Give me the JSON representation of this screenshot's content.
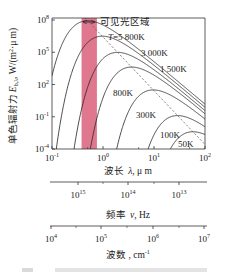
{
  "chart_data": {
    "type": "line",
    "title": "",
    "y_scale": "log",
    "x_scale": "log",
    "ylabel": "单色辐射力 E_b,λ, W/(m²·μm)",
    "xlabel": "波长 λ, μm",
    "xlim": [
      0.1,
      100
    ],
    "ylim": [
      0.0001,
      100000000
    ],
    "x_ticks": [
      {
        "value": 0.1,
        "base": "10",
        "exp": "-1"
      },
      {
        "value": 1,
        "base": "10",
        "exp": "0"
      },
      {
        "value": 10,
        "base": "10",
        "exp": "1"
      },
      {
        "value": 100,
        "base": "10",
        "exp": "2"
      }
    ],
    "y_ticks": [
      {
        "value": 100000000,
        "base": "10",
        "exp": "8"
      },
      {
        "value": 100000,
        "base": "10",
        "exp": "5"
      },
      {
        "value": 100,
        "base": "10",
        "exp": "2"
      },
      {
        "value": 0.1,
        "base": "10",
        "exp": "-1"
      },
      {
        "value": 0.0001,
        "base": "10",
        "exp": "-4"
      }
    ],
    "series": [
      {
        "name": "T=5 800K",
        "T": 5800,
        "label": "T=5 800K"
      },
      {
        "name": "3 000K",
        "T": 3000,
        "label": "3 000K"
      },
      {
        "name": "1 500K",
        "T": 1500,
        "label": "1 500K"
      },
      {
        "name": "800K",
        "T": 800,
        "label": "800K"
      },
      {
        "name": "300K",
        "T": 300,
        "label": "300K"
      },
      {
        "name": "100K",
        "T": 100,
        "label": "100K"
      },
      {
        "name": "50K",
        "T": 50,
        "label": "50K"
      }
    ],
    "wien_line": {
      "style": "dashed",
      "description": "locus of peak wavelength (λmax·T = 2898 μm·K)"
    },
    "annotation": {
      "visible_band": {
        "label": "可见光区域",
        "lambda_min": 0.38,
        "lambda_max": 0.76,
        "color": "#d9607a"
      }
    },
    "secondary_axes": [
      {
        "label": "频率 ν, Hz",
        "ticks": [
          {
            "value": 1000000000000000.0,
            "base": "10",
            "exp": "15"
          },
          {
            "value": 100000000000000.0,
            "base": "10",
            "exp": "14"
          },
          {
            "value": 10000000000000.0,
            "base": "10",
            "exp": "13"
          }
        ]
      },
      {
        "label": "波数, cm⁻¹",
        "ticks": [
          {
            "value": 10000.0,
            "base": "10",
            "exp": "4"
          },
          {
            "value": 100000.0,
            "base": "10",
            "exp": "5"
          },
          {
            "value": 1000000.0,
            "base": "10",
            "exp": "6"
          },
          {
            "value": 10000000.0,
            "base": "10",
            "exp": "7"
          }
        ]
      }
    ],
    "grid": false,
    "legend": "inline labels"
  },
  "labels": {
    "visible_region": "可见光区域",
    "ylabel_cn": "单色辐射力",
    "ylabel_sym": "E",
    "ylabel_sub": "b,λ",
    "ylabel_unit": ", W/(m",
    "ylabel_unit_sup": "2",
    "ylabel_unit_end": "·μ m)",
    "xlabel_cn": "波长",
    "xlabel_sym": "λ",
    "xlabel_unit": ", μ m",
    "freq_cn": "频率",
    "freq_sym": "ν",
    "freq_unit": ", Hz",
    "wn_cn": "波数",
    "wn_unit": " , cm",
    "wn_unit_sup": "-1"
  },
  "colors": {
    "visible_band": "#d9607a",
    "curve": "#2a2a2a",
    "axis": "#333333"
  }
}
